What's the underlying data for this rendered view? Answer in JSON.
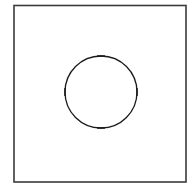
{
  "figure": {
    "background_color": "#ffffff",
    "width": 196,
    "height": 196
  },
  "frame": {
    "label": "border-rectangle",
    "x": 14,
    "y": 5.5,
    "width": 172,
    "height": 176.5,
    "stroke_color": "#3a3a3a",
    "stroke_width": 1.6,
    "fill_color": "#ffffff"
  },
  "circle": {
    "label": "circle-outline",
    "center_x": 101,
    "center_y": 92,
    "radius": 36,
    "stroke_color": "#1a1a1a",
    "stroke_width": 1.3,
    "fill": "none"
  },
  "ticks": [
    {
      "name": "tick-top",
      "position": "top",
      "angle_degrees": 90,
      "orientation": "horizontal",
      "center_x": 101,
      "center_y": 56,
      "length": 8,
      "stroke_color": "#1a1a1a",
      "stroke_width": 1.5
    },
    {
      "name": "tick-right",
      "position": "right",
      "angle_degrees": 0,
      "orientation": "vertical",
      "center_x": 137,
      "center_y": 92,
      "length": 8,
      "stroke_color": "#1a1a1a",
      "stroke_width": 1.5
    },
    {
      "name": "tick-bottom",
      "position": "bottom",
      "angle_degrees": 270,
      "orientation": "horizontal",
      "center_x": 101,
      "center_y": 128,
      "length": 8,
      "stroke_color": "#1a1a1a",
      "stroke_width": 1.5
    },
    {
      "name": "tick-left",
      "position": "left",
      "angle_degrees": 180,
      "orientation": "vertical",
      "center_x": 65,
      "center_y": 92,
      "length": 8,
      "stroke_color": "#1a1a1a",
      "stroke_width": 1.5
    }
  ]
}
